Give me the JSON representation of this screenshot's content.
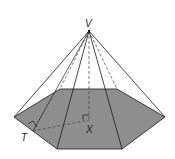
{
  "diagram": {
    "type": "hexagonal-pyramid",
    "labels": {
      "apex": "V",
      "base_center": "X",
      "edge_midpoint": "T"
    },
    "colors": {
      "base_fill": "#8e8e8e",
      "edge_stroke": "#1a1a1a",
      "hidden_stroke": "#444444",
      "background": "#ffffff"
    },
    "annotations": {
      "right_angle_at_T": true,
      "right_angle_at_X": true,
      "dashed_segments": [
        "VX",
        "TX",
        "hidden lateral edges"
      ]
    }
  }
}
